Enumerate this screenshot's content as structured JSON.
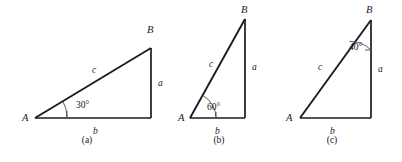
{
  "figure": {
    "background_color": "#ffffff",
    "line_color": "#1b1b20",
    "arc_color": "#4a4a52",
    "text_color": "#16161a",
    "panels": [
      {
        "caption": "(a)",
        "caption_x": 87,
        "caption_y": 143,
        "vertex_A": {
          "label": "A",
          "x": 35,
          "y": 118,
          "label_x": 22,
          "label_y": 121
        },
        "vertex_B": {
          "label": "B",
          "x": 151,
          "y": 48,
          "label_x": 147,
          "label_y": 33
        },
        "vertex_C": {
          "x": 151,
          "y": 118
        },
        "side_a": {
          "label": "a",
          "x": 158,
          "y": 86
        },
        "side_b": {
          "label": "b",
          "x": 93,
          "y": 134
        },
        "side_c": {
          "label": "c",
          "x": 92,
          "y": 73
        },
        "angle": {
          "label": "30°",
          "value": 30,
          "at_vertex": "A",
          "label_x": 76,
          "label_y": 108,
          "arc_radius": 32
        }
      },
      {
        "caption": "(b)",
        "caption_x": 219,
        "caption_y": 143,
        "vertex_A": {
          "label": "A",
          "x": 190,
          "y": 118,
          "label_x": 178,
          "label_y": 121
        },
        "vertex_B": {
          "label": "B",
          "x": 245,
          "y": 19,
          "label_x": 241,
          "label_y": 13
        },
        "vertex_C": {
          "x": 245,
          "y": 118
        },
        "side_a": {
          "label": "a",
          "x": 252,
          "y": 70
        },
        "side_b": {
          "label": "b",
          "x": 215,
          "y": 134
        },
        "side_c": {
          "label": "c",
          "x": 209,
          "y": 67
        },
        "angle": {
          "label": "60°",
          "value": 60,
          "at_vertex": "A",
          "label_x": 207,
          "label_y": 110,
          "arc_radius": 26
        }
      },
      {
        "caption": "(c)",
        "caption_x": 332,
        "caption_y": 143,
        "vertex_A": {
          "label": "A",
          "x": 300,
          "y": 118,
          "label_x": 286,
          "label_y": 121
        },
        "vertex_B": {
          "label": "B",
          "x": 371,
          "y": 20,
          "label_x": 366,
          "label_y": 13
        },
        "vertex_C": {
          "x": 371,
          "y": 118
        },
        "side_a": {
          "label": "a",
          "x": 378,
          "y": 72
        },
        "side_b": {
          "label": "b",
          "x": 330,
          "y": 134
        },
        "side_c": {
          "label": "c",
          "x": 318,
          "y": 70
        },
        "angle": {
          "label": "40°",
          "value": 40,
          "at_vertex": "B",
          "label_x": 349,
          "label_y": 50,
          "arc_radius": 30
        }
      }
    ]
  }
}
